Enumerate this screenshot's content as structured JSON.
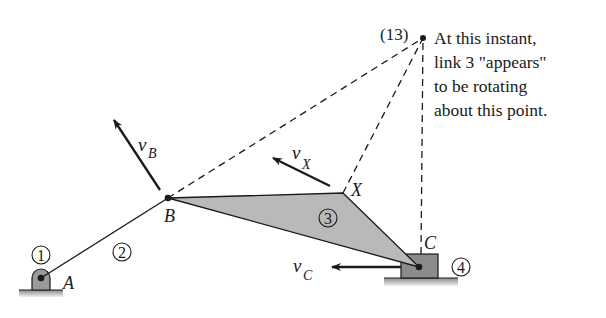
{
  "diagram": {
    "points": {
      "A": {
        "label": "A",
        "x": 41,
        "y": 278
      },
      "B": {
        "label": "B",
        "x": 168,
        "y": 198
      },
      "X": {
        "label": "X",
        "x": 343,
        "y": 193
      },
      "C": {
        "label": "C",
        "x": 419,
        "y": 267
      },
      "I13": {
        "label": "(13)",
        "x": 423,
        "y": 38
      }
    },
    "links": [
      {
        "id": "1",
        "label": "1",
        "name": "ground"
      },
      {
        "id": "2",
        "label": "2",
        "name": "crank"
      },
      {
        "id": "3",
        "label": "3",
        "name": "coupler"
      },
      {
        "id": "4",
        "label": "4",
        "name": "slider"
      }
    ],
    "velocities": {
      "vB": {
        "symbol": "v",
        "sub": "B"
      },
      "vX": {
        "symbol": "v",
        "sub": "X"
      },
      "vC": {
        "symbol": "v",
        "sub": "C"
      }
    },
    "annotation": {
      "lines": [
        "At this instant,",
        "link 3 \"appears\"",
        "to be rotating",
        "about this point."
      ]
    },
    "colors": {
      "coupler_fill": "#b9b9b9",
      "slider_fill": "#8c8c8c",
      "pin_fill": "#9a9a9a",
      "ground_fill": "#a8a8a8",
      "line": "#1a1a1a"
    }
  }
}
